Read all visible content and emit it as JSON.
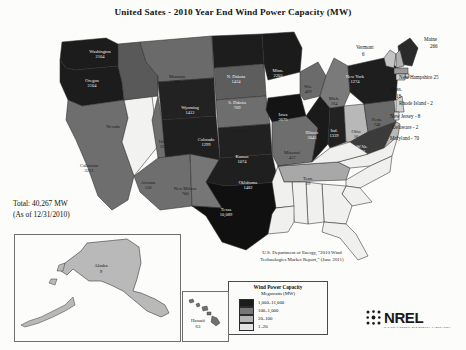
{
  "title": "United Sates - 2010 Year End Wind Power Capacity (MW)",
  "total": {
    "line1": "Total: 40,267 MW",
    "line2": "(As of 12/31/2010)"
  },
  "source": {
    "line1": "U.S. Department of Energy, \"2010 Wind",
    "line2": "Technologies Market Report,\" (June 2011)"
  },
  "legend": {
    "title": "Wind Power Capacity",
    "subtitle": "Megawatts (MW)",
    "items": [
      {
        "label": "1,000–11,000",
        "color": "#1c1c1c"
      },
      {
        "label": "100–1,000",
        "color": "#767676"
      },
      {
        "label": "20–100",
        "color": "#b4b4b4"
      },
      {
        "label": "1–20",
        "color": "#e3e3e3"
      }
    ]
  },
  "insets": {
    "alaska": {
      "name": "Alaska",
      "value": "9"
    },
    "hawaii": {
      "name": "Hawaii",
      "value": "63"
    }
  },
  "logo": {
    "word": "NREL",
    "subtitle": "NATIONAL RENEWABLE ENERGY LABORATORY"
  },
  "northeast_callouts": [
    {
      "name": "Vermont",
      "value": "6",
      "x": 356,
      "y": 44,
      "stack": true
    },
    {
      "name": "Maine",
      "value": "266",
      "x": 424,
      "y": 36,
      "stack": true
    },
    {
      "name": "New Hampshire",
      "value": "25",
      "x": 399,
      "y": 74,
      "stack": false
    },
    {
      "name": "Mass.",
      "value": "18",
      "x": 390,
      "y": 86,
      "stack": true
    },
    {
      "name": "Rhode Island - 2",
      "value": "",
      "x": 399,
      "y": 100,
      "stack": false
    },
    {
      "name": "New Jersey - 8",
      "value": "",
      "x": 390,
      "y": 113,
      "stack": false
    },
    {
      "name": "Delaware - 2",
      "value": "",
      "x": 392,
      "y": 124,
      "stack": false
    },
    {
      "name": "Maryland - 70",
      "value": "",
      "x": 390,
      "y": 135,
      "stack": false
    }
  ],
  "chart_data": {
    "type": "map",
    "title": "United Sates - 2010 Year End Wind Power Capacity (MW)",
    "unit": "MW",
    "total": 40267,
    "as_of": "12/31/2010",
    "bins": [
      {
        "range": "1,000-11,000",
        "min": 1000,
        "max": 11000,
        "color": "#1c1c1c"
      },
      {
        "range": "100-1,000",
        "min": 100,
        "max": 1000,
        "color": "#767676"
      },
      {
        "range": "20-100",
        "min": 20,
        "max": 100,
        "color": "#b4b4b4"
      },
      {
        "range": "1-20",
        "min": 1,
        "max": 20,
        "color": "#e3e3e3"
      }
    ],
    "states": [
      {
        "name": "Washington",
        "value": 2104
      },
      {
        "name": "Oregon",
        "value": 2104
      },
      {
        "name": "Idaho",
        "value": 353
      },
      {
        "name": "Montana",
        "value": 386
      },
      {
        "name": "Wyoming",
        "value": 1412
      },
      {
        "name": "Utah",
        "value": 223
      },
      {
        "name": "Colorado",
        "value": 1299
      },
      {
        "name": "California",
        "value": 3251
      },
      {
        "name": "Arizona",
        "value": 128
      },
      {
        "name": "New Mexico",
        "value": 700
      },
      {
        "name": "N. Dakota",
        "value": 1424
      },
      {
        "name": "S. Dakota",
        "value": 709
      },
      {
        "name": "Minn.",
        "value": 2203
      },
      {
        "name": "Nebraska",
        "value": 213
      },
      {
        "name": "Iowa",
        "value": 3675
      },
      {
        "name": "Kansas",
        "value": 1074
      },
      {
        "name": "Missouri",
        "value": 457
      },
      {
        "name": "Oklahoma",
        "value": 1482
      },
      {
        "name": "Texas",
        "value": 10089
      },
      {
        "name": "Wis.",
        "value": 469
      },
      {
        "name": "Illinois",
        "value": 2045
      },
      {
        "name": "Ind.",
        "value": 1339
      },
      {
        "name": "Mich.",
        "value": 164
      },
      {
        "name": "Ohio",
        "value": 10
      },
      {
        "name": "W.Va.",
        "value": 431
      },
      {
        "name": "Penn.",
        "value": 748
      },
      {
        "name": "New York",
        "value": 1274
      },
      {
        "name": "Tenn.",
        "value": 29
      },
      {
        "name": "Vermont",
        "value": 6
      },
      {
        "name": "Maine",
        "value": 266
      },
      {
        "name": "New Hampshire",
        "value": 25
      },
      {
        "name": "Mass.",
        "value": 18
      },
      {
        "name": "Rhode Island",
        "value": 2
      },
      {
        "name": "New Jersey",
        "value": 8
      },
      {
        "name": "Delaware",
        "value": 2
      },
      {
        "name": "Maryland",
        "value": 70
      },
      {
        "name": "Alaska",
        "value": 9
      },
      {
        "name": "Hawaii",
        "value": 63
      }
    ]
  },
  "map_states": [
    {
      "key": "wa",
      "name": "Washington",
      "value": "2104",
      "fill": "#1c1c1c",
      "label": "dark",
      "lx": 100,
      "ly": 37,
      "d": "M62,22 L106,18 L118,24 L120,38 L118,46 L96,48 L76,50 L66,48 L60,40 Z"
    },
    {
      "key": "or",
      "name": "Oregon",
      "value": "2104",
      "fill": "#1c1c1c",
      "label": "dark",
      "lx": 92,
      "ly": 66,
      "d": "M60,40 L66,48 L76,50 L96,48 L118,46 L122,62 L124,80 L82,86 L68,80 L60,62 Z"
    },
    {
      "key": "ca",
      "name": "California",
      "value": "3251",
      "fill": "#6e6e6e",
      "label": "light",
      "lx": 89,
      "ly": 151,
      "d": "M68,80 L82,86 L124,80 L128,98 L122,122 L134,156 L128,180 L112,190 L98,176 L88,148 L76,120 L66,100 Z"
    },
    {
      "key": "nv",
      "name": "Nevada",
      "value": "",
      "fill": "#f2f2f0",
      "label": "light",
      "lx": 113,
      "ly": 112,
      "d": "M124,80 L152,76 L158,126 L134,156 L122,122 L128,98 Z"
    },
    {
      "key": "id",
      "name": "Idaho",
      "value": "353",
      "fill": "#595959",
      "label": "dark",
      "lx": 138,
      "ly": 88,
      "d": "M118,24 L140,22 L146,42 L158,56 L158,76 L124,80 L122,62 L118,46 Z"
    },
    {
      "key": "mt",
      "name": "Montana",
      "value": "386",
      "fill": "#6a6a6a",
      "label": "light",
      "lx": 177,
      "ly": 62,
      "d": "M140,22 L212,16 L214,58 L158,62 L158,56 L146,42 Z"
    },
    {
      "key": "wy",
      "name": "Wyoming",
      "value": "1412",
      "fill": "#222222",
      "label": "dark",
      "lx": 190,
      "ly": 93,
      "d": "M158,62 L214,58 L216,96 L162,100 Z"
    },
    {
      "key": "ut",
      "name": "Utah",
      "value": "223",
      "fill": "#6e6e6e",
      "label": "light",
      "lx": 163,
      "ly": 127,
      "d": "M158,76 L162,100 L190,98 L192,134 L158,138 L152,100 Z"
    },
    {
      "key": "co",
      "name": "Colorado",
      "value": "1299",
      "fill": "#1f1f1f",
      "label": "dark",
      "lx": 206,
      "ly": 125,
      "d": "M162,100 L216,96 L220,140 L166,144 Z"
    },
    {
      "key": "az",
      "name": "Arizona",
      "value": "128",
      "fill": "#6e6e6e",
      "label": "light",
      "lx": 148,
      "ly": 168,
      "d": "M158,138 L190,134 L192,186 L160,190 L140,172 L134,156 Z"
    },
    {
      "key": "nm",
      "name": "New Mixico",
      "value": "700",
      "fill": "#767676",
      "label": "light",
      "lx": 185,
      "ly": 174,
      "d": "M190,134 L220,140 L222,188 L192,186 Z"
    },
    {
      "key": "nd",
      "name": "N. Dakota",
      "value": "1424",
      "fill": "#1d1d1d",
      "label": "dark",
      "lx": 236,
      "ly": 62,
      "d": "M212,16 L262,14 L264,44 L214,48 Z"
    },
    {
      "key": "sd",
      "name": "S. Dakota",
      "value": "709",
      "fill": "#5d5d5d",
      "label": "dark",
      "lx": 237,
      "ly": 88,
      "d": "M214,48 L264,44 L266,76 L216,80 Z"
    },
    {
      "key": "ne",
      "name": "Nebraska",
      "value": "213",
      "fill": "#6e6e6e",
      "label": "light",
      "lx": 239,
      "ly": 116,
      "d": "M216,80 L266,76 L270,104 L218,108 Z"
    },
    {
      "key": "ks",
      "name": "Kansas",
      "value": "1074",
      "fill": "#212121",
      "label": "dark",
      "lx": 242,
      "ly": 142,
      "d": "M218,108 L270,104 L272,134 L220,138 Z"
    },
    {
      "key": "ok",
      "name": "Oklahoma",
      "value": "1482",
      "fill": "#1f1f1f",
      "label": "dark",
      "lx": 248,
      "ly": 168,
      "d": "M220,138 L272,134 L278,162 L226,166 L206,162 Z"
    },
    {
      "key": "tx",
      "name": "Texas",
      "value": "10,089",
      "fill": "#101010",
      "label": "dark",
      "lx": 226,
      "ly": 195,
      "d": "M206,162 L226,166 L278,162 L284,186 L268,214 L246,230 L222,222 L206,196 L192,186 L222,188 Z"
    },
    {
      "key": "mn",
      "name": "Minn.",
      "value": "2203",
      "fill": "#1b1b1b",
      "label": "dark",
      "lx": 278,
      "ly": 56,
      "d": "M262,14 L294,12 L302,28 L300,52 L268,60 L264,44 Z"
    },
    {
      "key": "ia",
      "name": "Iowa",
      "value": "3675",
      "fill": "#141414",
      "label": "dark",
      "lx": 283,
      "ly": 100,
      "d": "M268,78 L300,74 L306,96 L272,102 L266,90 Z"
    },
    {
      "key": "wi",
      "name": "Wis.",
      "value": "469",
      "fill": "#6b6b6b",
      "label": "light",
      "lx": 308,
      "ly": 72,
      "d": "M300,52 L318,42 L326,56 L320,76 L304,80 L300,74 Z"
    },
    {
      "key": "mo",
      "name": "Missouri",
      "value": "457",
      "fill": "#6e6e6e",
      "label": "light",
      "lx": 292,
      "ly": 138,
      "d": "M272,102 L306,96 L318,108 L312,142 L278,146 L272,134 Z"
    },
    {
      "key": "il",
      "name": "Illinois",
      "value": "2045",
      "fill": "#1a1a1a",
      "label": "dark",
      "lx": 312,
      "ly": 118,
      "d": "M306,96 L320,76 L330,88 L328,124 L312,142 L318,108 Z"
    },
    {
      "key": "in",
      "name": "Ind.",
      "value": "1339",
      "fill": "#222222",
      "label": "dark",
      "lx": 334,
      "ly": 116,
      "d": "M330,88 L344,86 L346,122 L330,128 L328,124 Z"
    },
    {
      "key": "mi",
      "name": "Mich.",
      "value": "164",
      "fill": "#7a7a7a",
      "label": "light",
      "lx": 334,
      "ly": 84,
      "d": "M326,56 L334,38 L348,46 L350,72 L344,86 L330,88 L320,76 Z"
    },
    {
      "key": "oh",
      "name": "Ohio",
      "value": "10",
      "fill": "#b8b8b8",
      "label": "light",
      "lx": 356,
      "ly": 117,
      "d": "M344,86 L364,84 L368,112 L350,122 L346,122 Z"
    },
    {
      "key": "pa",
      "name": "Penn.",
      "value": "748",
      "fill": "#6a6a6a",
      "label": "light",
      "lx": 377,
      "ly": 105,
      "d": "M364,84 L394,80 L396,102 L368,112 Z"
    },
    {
      "key": "ny",
      "name": "New York",
      "value": "1274",
      "fill": "#1e1e1e",
      "label": "dark",
      "lx": 355,
      "ly": 62,
      "d": "M348,46 L384,38 L398,48 L396,80 L364,84 L350,72 Z"
    },
    {
      "key": "wv",
      "name": "W.Va.",
      "value": "431",
      "fill": "#3b3b3b",
      "label": "dark",
      "lx": 362,
      "ly": 132,
      "d": "M368,112 L396,102 L384,128 L368,134 L350,122 Z"
    },
    {
      "key": "tn",
      "name": "Tenn.",
      "value": "29",
      "fill": "#a8a8a8",
      "label": "light",
      "lx": 308,
      "ly": 164,
      "d": "M278,146 L338,142 L350,148 L346,160 L284,162 Z"
    },
    {
      "key": "vt",
      "name": "Vermont",
      "value": "",
      "fill": "#c4c4c4",
      "label": "light",
      "lx": 0,
      "ly": 0,
      "d": "M384,38 L390,30 L396,34 L394,48 L386,46 Z"
    },
    {
      "key": "me",
      "name": "Maine",
      "value": "",
      "fill": "#2a2a2a",
      "label": "dark",
      "lx": 0,
      "ly": 0,
      "d": "M398,26 L410,18 L418,28 L412,46 L400,44 Z"
    },
    {
      "key": "nh",
      "name": "New Hampshire",
      "value": "",
      "fill": "#b0b0b0",
      "label": "light",
      "lx": 0,
      "ly": 0,
      "d": "M396,34 L400,30 L404,46 L396,48 Z"
    },
    {
      "key": "ma",
      "name": "Mass.",
      "value": "",
      "fill": "#9a9a9a",
      "label": "light",
      "lx": 0,
      "ly": 0,
      "d": "M394,48 L408,48 L408,54 L394,54 Z"
    },
    {
      "key": "ri",
      "name": "Rhode Island",
      "value": "",
      "fill": "#d8d8d8",
      "label": "light",
      "lx": 0,
      "ly": 0,
      "d": "M405,54 L409,54 L409,58 L405,58 Z"
    },
    {
      "key": "ct",
      "name": "Connecticut",
      "value": "",
      "fill": "#cfcfcf",
      "label": "light",
      "lx": 0,
      "ly": 0,
      "d": "M396,54 L405,54 L405,60 L396,60 Z"
    },
    {
      "key": "nj",
      "name": "New Jersey",
      "value": "",
      "fill": "#d0d0d0",
      "label": "light",
      "lx": 0,
      "ly": 0,
      "d": "M396,80 L402,76 L404,92 L396,92 Z"
    },
    {
      "key": "de",
      "name": "Delaware",
      "value": "",
      "fill": "#dcdcdc",
      "label": "light",
      "lx": 0,
      "ly": 0,
      "d": "M394,92 L399,92 L399,100 L394,100 Z"
    },
    {
      "key": "md",
      "name": "Maryland",
      "value": "",
      "fill": "#b8b8b8",
      "label": "light",
      "lx": 0,
      "ly": 0,
      "d": "M384,128 L396,102 L400,104 L398,116 L386,132 Z"
    },
    {
      "key": "va",
      "name": "Virginia",
      "value": "",
      "fill": "#f0f0ee",
      "label": "light",
      "lx": 0,
      "ly": 0,
      "d": "M368,134 L384,128 L398,116 L392,136 L370,146 L350,148 L338,142 Z"
    },
    {
      "key": "ky",
      "name": "Kentucky",
      "value": "",
      "fill": "#f0f0ee",
      "label": "light",
      "lx": 0,
      "ly": 0,
      "d": "M312,142 L330,128 L350,122 L368,134 L338,142 L278,146 Z"
    },
    {
      "key": "nc",
      "name": "North Carolina",
      "value": "",
      "fill": "#f0f0ee",
      "label": "light",
      "lx": 0,
      "ly": 0,
      "d": "M346,160 L370,146 L392,136 L390,152 L360,168 L346,166 Z"
    },
    {
      "key": "sc",
      "name": "South Carolina",
      "value": "",
      "fill": "#f0f0ee",
      "label": "light",
      "lx": 0,
      "ly": 0,
      "d": "M346,166 L360,168 L372,182 L352,186 L342,174 Z"
    },
    {
      "key": "ga",
      "name": "Georgia",
      "value": "",
      "fill": "#f0f0ee",
      "label": "light",
      "lx": 0,
      "ly": 0,
      "d": "M322,164 L346,166 L342,174 L352,186 L346,204 L324,202 Z"
    },
    {
      "key": "fl",
      "name": "Florida",
      "value": "",
      "fill": "#f0f0ee",
      "label": "light",
      "lx": 0,
      "ly": 0,
      "d": "M324,202 L346,204 L356,214 L368,236 L358,240 L340,218 L322,212 Z"
    },
    {
      "key": "al",
      "name": "Alabama",
      "value": "",
      "fill": "#f0f0ee",
      "label": "light",
      "lx": 0,
      "ly": 0,
      "d": "M306,162 L322,164 L324,202 L308,204 Z"
    },
    {
      "key": "ms",
      "name": "Mississippi",
      "value": "",
      "fill": "#f0f0ee",
      "label": "light",
      "lx": 0,
      "ly": 0,
      "d": "M292,162 L306,162 L308,204 L294,202 Z"
    },
    {
      "key": "ar",
      "name": "Arkansas",
      "value": "",
      "fill": "#f0f0ee",
      "label": "light",
      "lx": 0,
      "ly": 0,
      "d": "M278,146 L284,162 L292,162 L294,186 L276,188 L272,162 Z"
    },
    {
      "key": "la",
      "name": "Louisiana",
      "value": "",
      "fill": "#f0f0ee",
      "label": "light",
      "lx": 0,
      "ly": 0,
      "d": "M276,188 L294,186 L294,202 L288,212 L268,214 L272,194 Z"
    }
  ]
}
